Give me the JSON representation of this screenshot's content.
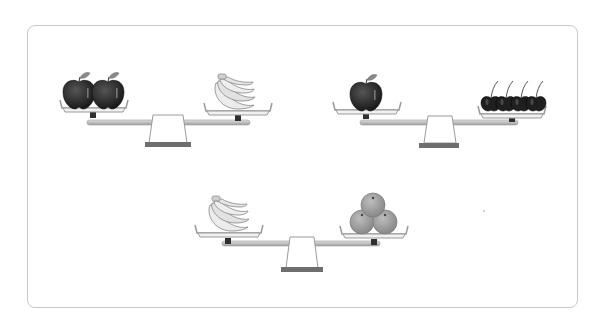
{
  "puzzle": {
    "description": "Balance scale fruit comparison",
    "scales": [
      {
        "left": {
          "fruit": "apple",
          "count": 2
        },
        "right": {
          "fruit": "banana",
          "count": 1,
          "form": "bunch"
        },
        "tilt": "level"
      },
      {
        "left": {
          "fruit": "apple",
          "count": 1
        },
        "right": {
          "fruit": "cherry",
          "count": 4
        },
        "tilt": "level"
      },
      {
        "left": {
          "fruit": "banana",
          "count": 1,
          "form": "bunch"
        },
        "right": {
          "fruit": "orange",
          "count": 3
        },
        "tilt": "level"
      }
    ]
  },
  "colors": {
    "card_border": "#c9c9c9",
    "apple": "#2b2b2b",
    "leaf": "#8a8a8a",
    "banana": "#e6e6e6",
    "cherry": "#1f1f1f",
    "orange": "#9a9a9a",
    "beam": "#b5b5b5",
    "fulcrum_base": "#6e6e6e"
  }
}
